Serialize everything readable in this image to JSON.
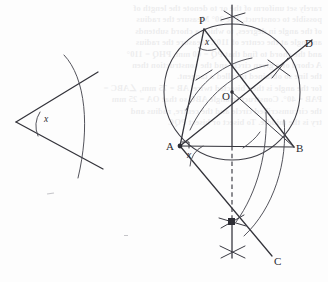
{
  "figure": {
    "ink_color": "#33333a",
    "background_color": "#fdfdfd",
    "width": 328,
    "height": 282
  },
  "bleed_text": {
    "note": "faint mirrored show-through text from reverse side of page",
    "lines": "rarely set uniform of the or to denote the length of\npossible to construct. The 30° Measure the radius\nof the angle in degrees, to which a chord subtends\nan angle at the centre of 110°. Measure the radius\nand the chord to find that PQ = 60 mm, PHQ = 110°\nA chord of a given circle and the construction then\nthe line so obtained is called a tangent.\nfor the angle is then bisected twice. AB = 75 mm, ∠ABC =\nPAB = 40°. Construct triangle ABC so that OA = 25 mm\nthe circumscribed circle and the centre, radius and\ntry is the middle. To bisect or bisect PQC"
  },
  "left_diagram": {
    "name": "given-angle-x",
    "vertex_label": "",
    "angle_label": "x",
    "description": "given angle x formed by two rays from a left vertex, crossed by a single construction arc"
  },
  "right_diagram": {
    "name": "circle-construction",
    "points": [
      {
        "id": "P",
        "label": "P",
        "x": 203,
        "y": 22,
        "on_circle": true
      },
      {
        "id": "O",
        "label": "O",
        "x": 227,
        "y": 98,
        "on_circle": false,
        "role": "centre"
      },
      {
        "id": "A",
        "label": "A",
        "x": 171,
        "y": 148,
        "on_circle": true
      },
      {
        "id": "B",
        "label": "B",
        "x": 299,
        "y": 150,
        "on_circle": true
      },
      {
        "id": "D",
        "label": "D",
        "x": 308,
        "y": 45,
        "on_circle": false
      },
      {
        "id": "C",
        "label": "C",
        "x": 277,
        "y": 263,
        "on_circle": false
      }
    ],
    "angle_marks": [
      {
        "at": "P",
        "label": "x"
      },
      {
        "at": "A",
        "label": "x"
      }
    ],
    "segments": [
      "A-P",
      "P-B",
      "A-B",
      "A-O",
      "O-B",
      "A-D",
      "A-C"
    ],
    "construction_elements": [
      "main circle centred at O through A, P and B",
      "arc of radius AO swung about A",
      "arc swung about B meeting the perpendicular bisector",
      "perpendicular bisector of AB shown as a vertical dashed line",
      "pairs of crossed arc ticks marking intersections",
      "right-angle tick at A between AB and AC"
    ],
    "circle": {
      "cx": 232,
      "cy": 92,
      "r": 68
    }
  }
}
